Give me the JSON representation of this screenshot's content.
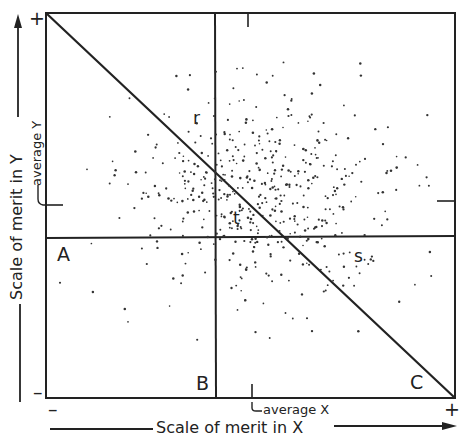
{
  "diagram": {
    "x_axis_title": "Scale of merit in X",
    "y_axis_title": "Scale of merit in Y",
    "average_x_label": "average X",
    "average_y_label": "average Y",
    "y_plus": "+",
    "y_minus": "–",
    "x_minus": "–",
    "x_plus": "+",
    "point_labels": {
      "A": "A",
      "B": "B",
      "C": "C",
      "r": "r",
      "s": "s",
      "t": "t"
    },
    "colors": {
      "ink": "#222222",
      "dots": "#333333",
      "background": "#ffffff"
    }
  }
}
